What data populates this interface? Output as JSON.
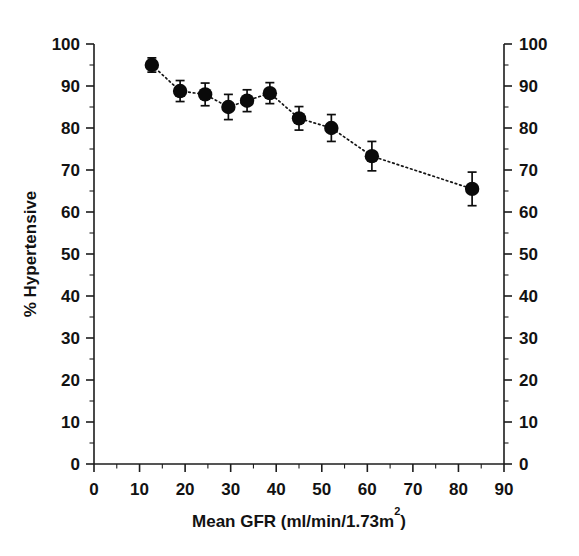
{
  "figure": {
    "background_color": "#ffffff",
    "marker_color": "#0a0a0a",
    "line_color": "#151515",
    "axis_color": "#1c1c1c"
  },
  "axes": {
    "left_label": "% Hypertensive",
    "bottom_label_main": "Mean GFR (ml/min/1.73m",
    "bottom_label_sup": "2",
    "bottom_label_tail": ")",
    "x_ticks": [
      "0",
      "10",
      "20",
      "30",
      "40",
      "50",
      "60",
      "70",
      "80",
      "90"
    ],
    "y_ticks_left": [
      "0",
      "10",
      "20",
      "30",
      "40",
      "50",
      "60",
      "70",
      "80",
      "90",
      "100"
    ],
    "y_ticks_right": [
      "0",
      "10",
      "20",
      "30",
      "40",
      "50",
      "60",
      "70",
      "80",
      "90",
      "100"
    ]
  },
  "chart_data": {
    "type": "scatter",
    "title": "",
    "xlabel": "Mean GFR (ml/min/1.73m2)",
    "ylabel": "% Hypertensive",
    "xlim": [
      0,
      90
    ],
    "ylim": [
      0,
      100
    ],
    "x_tick_step": 10,
    "y_tick_step": 10,
    "x_minor_step": 5,
    "y_minor_step": 5,
    "grid": false,
    "legend": "none",
    "connector": "dotted-line",
    "error_bars": "vertical-with-caps",
    "x": [
      12.7,
      18.9,
      24.4,
      29.5,
      33.6,
      38.6,
      45.0,
      52.1,
      61.0,
      83.0
    ],
    "y": [
      95.0,
      88.8,
      88.0,
      85.0,
      86.5,
      88.3,
      82.3,
      80.0,
      73.3,
      65.5
    ],
    "y_err": [
      1.7,
      2.5,
      2.7,
      3.0,
      2.6,
      2.5,
      2.8,
      3.2,
      3.5,
      4.0
    ],
    "series": [
      {
        "name": "% Hypertensive vs Mean GFR",
        "points": [
          {
            "x": 12.7,
            "y": 95.0,
            "err": 1.7
          },
          {
            "x": 18.9,
            "y": 88.8,
            "err": 2.5
          },
          {
            "x": 24.4,
            "y": 88.0,
            "err": 2.7
          },
          {
            "x": 29.5,
            "y": 85.0,
            "err": 3.0
          },
          {
            "x": 33.6,
            "y": 86.5,
            "err": 2.6
          },
          {
            "x": 38.6,
            "y": 88.3,
            "err": 2.5
          },
          {
            "x": 45.0,
            "y": 82.3,
            "err": 2.8
          },
          {
            "x": 52.1,
            "y": 80.0,
            "err": 3.2
          },
          {
            "x": 61.0,
            "y": 73.3,
            "err": 3.5
          },
          {
            "x": 83.0,
            "y": 65.5,
            "err": 4.0
          }
        ]
      }
    ]
  }
}
